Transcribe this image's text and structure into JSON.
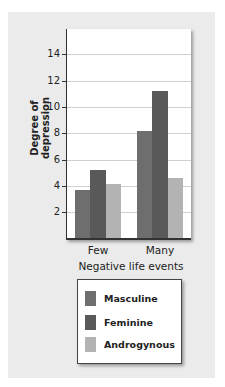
{
  "chart_data": {
    "type": "bar",
    "title": "",
    "xlabel": "Negative life events",
    "ylabel": "Degree of depression",
    "categories": [
      "Few",
      "Many"
    ],
    "series": [
      {
        "name": "Masculine",
        "values": [
          3.7,
          8.2
        ],
        "color": "#6e6e6e"
      },
      {
        "name": "Feminine",
        "values": [
          5.2,
          11.2
        ],
        "color": "#595959"
      },
      {
        "name": "Androgynous",
        "values": [
          4.1,
          4.6
        ],
        "color": "#b3b3b3"
      }
    ],
    "yticks": [
      2,
      4,
      6,
      8,
      10,
      12,
      14
    ],
    "ylim": [
      0,
      16
    ],
    "grid": true,
    "legend_position": "bottom"
  },
  "labels": {
    "ytitle": "Degree of depression",
    "xtitle": "Negative life events",
    "cat0": "Few",
    "cat1": "Many",
    "tick2": "2",
    "tick4": "4",
    "tick6": "6",
    "tick8": "8",
    "tick10": "10",
    "tick12": "12",
    "tick14": "14",
    "legend0": "Masculine",
    "legend1": "Feminine",
    "legend2": "Androgynous"
  }
}
